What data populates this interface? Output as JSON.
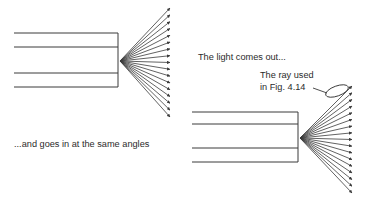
{
  "figure": {
    "background_color": "#ffffff",
    "stroke_color": "#3a3a3a",
    "text_color": "#2b2b2b"
  },
  "labels": {
    "goes_in": "...and goes in at the same angles",
    "comes_out": "The light comes out...",
    "ray_used_line1": "The ray used",
    "ray_used_line2": "in Fig. 4.14"
  },
  "diagrams": {
    "left": {
      "name": "light-pipe-entry",
      "pipe": {
        "x": 14,
        "y": 33,
        "width": 104,
        "height": 54
      },
      "inner_lines_y": [
        47,
        73
      ],
      "focus": {
        "x": 120,
        "y": 61
      },
      "fan": {
        "ray_count": 17,
        "tip_x": 170,
        "tip_y_start": 8,
        "tip_y_end": 117
      }
    },
    "right": {
      "name": "light-pipe-exit",
      "pipe": {
        "x": 192,
        "y": 112,
        "width": 106,
        "height": 50
      },
      "inner_lines_y": [
        124,
        148
      ],
      "focus": {
        "x": 300,
        "y": 138
      },
      "fan": {
        "ray_count": 17,
        "tip_x": 352,
        "tip_y_start": 86,
        "tip_y_end": 193
      },
      "callout_ellipse": {
        "cx": 337,
        "cy": 91,
        "rx": 12,
        "ry": 5,
        "rotation": -20
      },
      "leader_line": {
        "x1": 313,
        "y1": 88,
        "x2": 327,
        "y2": 93
      }
    }
  },
  "text_positions": {
    "goes_in": {
      "x": 14,
      "y": 147
    },
    "comes_out": {
      "x": 198,
      "y": 60
    },
    "ray_used_line1": {
      "x": 260,
      "y": 78
    },
    "ray_used_line2": {
      "x": 260,
      "y": 90
    }
  },
  "chart_data": {
    "type": "diagram",
    "elements": [
      {
        "id": "left-pipe",
        "kind": "rectangle",
        "note": "open-ended light pipe, rays enter converging"
      },
      {
        "id": "left-fan",
        "kind": "ray-fan",
        "rays": 17,
        "direction": "converging-to-pipe-end"
      },
      {
        "id": "right-pipe",
        "kind": "rectangle",
        "note": "open-ended light pipe, rays exit diverging"
      },
      {
        "id": "right-fan",
        "kind": "ray-fan",
        "rays": 17,
        "direction": "diverging-from-pipe-end"
      },
      {
        "id": "callout",
        "kind": "ellipse",
        "note": "highlights the topmost exit ray"
      }
    ]
  }
}
